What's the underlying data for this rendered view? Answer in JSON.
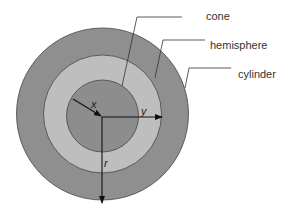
{
  "diagram": {
    "type": "concentric-circles cross-section",
    "labels": {
      "cone": "cone",
      "hemisphere": "hemisphere",
      "cylinder": "cylinder"
    },
    "variables": {
      "x": "x",
      "y": "y",
      "r": "r"
    },
    "colors": {
      "outer_ring": "#8f8f8f",
      "middle_ring": "#bebebe",
      "inner_disk": "#8d8d8d",
      "stroke": "#333333",
      "background": "#ffffff"
    }
  }
}
